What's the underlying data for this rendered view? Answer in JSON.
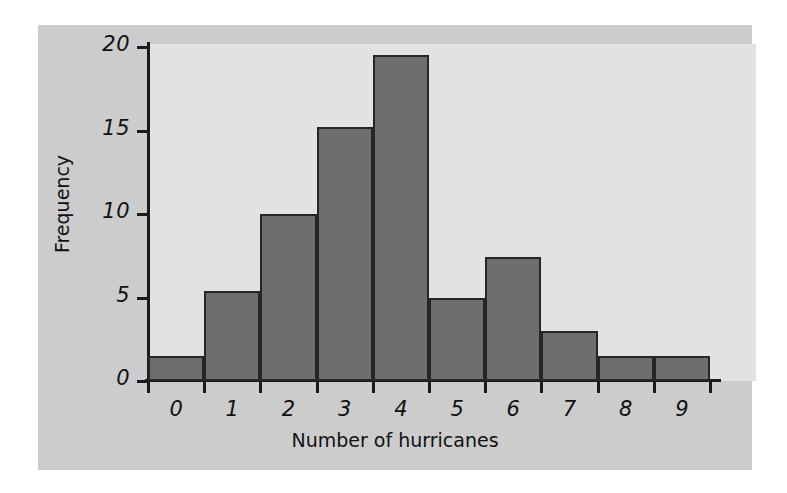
{
  "chart_data": {
    "type": "bar",
    "title": "",
    "xlabel": "Number of hurricanes",
    "ylabel": "Frequency",
    "categories": [
      "0",
      "1",
      "2",
      "3",
      "4",
      "5",
      "6",
      "7",
      "8",
      "9"
    ],
    "values": [
      1.5,
      5.4,
      10.0,
      15.2,
      19.5,
      5.0,
      7.4,
      3.0,
      1.5,
      1.5
    ],
    "ylim": [
      0,
      20
    ],
    "yticks": [
      0,
      5,
      10,
      15,
      20
    ],
    "ytick_labels": [
      "0",
      "5",
      "10",
      "15",
      "20"
    ],
    "xtick_labels": [
      "0",
      "1",
      "2",
      "3",
      "4",
      "5",
      "6",
      "7",
      "8",
      "9"
    ],
    "grid": false,
    "legend": null,
    "bar_color": "#6e6e6e",
    "bar_edge_color": "#262626",
    "plot_background": "#e2e2e2",
    "figure_background": "#cccccc"
  }
}
